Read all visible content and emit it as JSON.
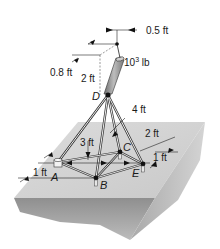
{
  "figure": {
    "type": "3D statics diagram: pole supported by tripod legs on a base block",
    "load": {
      "label": "10³ lb",
      "base": "10",
      "exp": "3",
      "unit": " lb"
    },
    "dimensions": {
      "offset_x": "0.5 ft",
      "offset_z": "0.8 ft",
      "pole_height": "2 ft",
      "height_D": "4 ft",
      "depth_AC": "3 ft",
      "spacing_CE": "2 ft",
      "offset_E": "1 ft",
      "offset_A": "1 ft"
    },
    "points": {
      "A": "A",
      "B": "B",
      "C": "C",
      "D": "D",
      "E": "E"
    }
  }
}
